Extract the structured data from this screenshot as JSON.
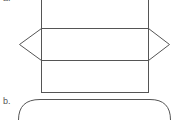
{
  "figure": {
    "part_a": {
      "label": "a."
    },
    "part_b": {
      "label": "b."
    }
  },
  "colors": {
    "stroke": "#555555",
    "background": "#ffffff"
  }
}
